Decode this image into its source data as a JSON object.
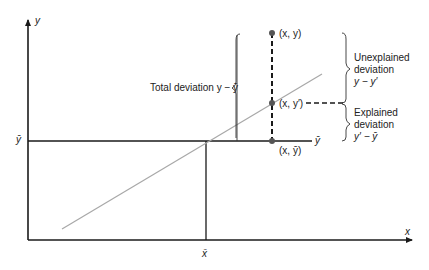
{
  "diagram": {
    "axes": {
      "x_label": "x",
      "y_label": "y",
      "x_mean_label": "x̄",
      "y_mean_label": "ȳ",
      "y_mean_right_label": "ȳ"
    },
    "points": [
      {
        "name": "observed",
        "label": "(x, y)"
      },
      {
        "name": "predicted",
        "label": "(x, y′)"
      },
      {
        "name": "mean",
        "label": "(x, ȳ)"
      }
    ],
    "annotations": {
      "total_deviation": "Total deviation y − ȳ",
      "unexplained": {
        "line1": "Unexplained",
        "line2": "deviation",
        "line3": "y − y′"
      },
      "explained": {
        "line1": "Explained",
        "line2": "deviation",
        "line3": "y′ − ȳ"
      }
    },
    "colors": {
      "axis": "#1a1a1a",
      "regression_line": "#a8a8a8",
      "point": "#555555",
      "text": "#222222"
    }
  }
}
